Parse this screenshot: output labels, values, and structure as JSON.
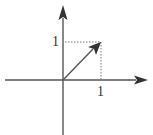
{
  "diagram": {
    "type": "vector-on-axes",
    "vector": {
      "from": [
        0,
        0
      ],
      "to": [
        1,
        1
      ]
    },
    "labels": {
      "x_tick": "1",
      "y_tick": "1"
    },
    "colors": {
      "axis": "#444444",
      "vector": "#444444",
      "guide": "#666666"
    }
  }
}
